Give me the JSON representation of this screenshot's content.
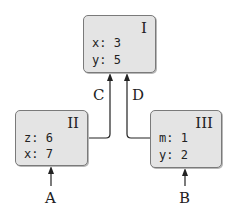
{
  "diagram": {
    "nodes": [
      {
        "id": "I",
        "title": "I",
        "fields": [
          {
            "text": "x: 3"
          },
          {
            "text": "y: 5"
          }
        ]
      },
      {
        "id": "II",
        "title": "II",
        "fields": [
          {
            "text": "z: 6"
          },
          {
            "text": "x: 7"
          }
        ]
      },
      {
        "id": "III",
        "title": "III",
        "fields": [
          {
            "text": "m: 1"
          },
          {
            "text": "y: 2"
          }
        ]
      }
    ],
    "edges": [
      {
        "label": "C",
        "from": "II",
        "to": "I"
      },
      {
        "label": "D",
        "from": "III",
        "to": "I"
      },
      {
        "label": "A",
        "from": "external",
        "to": "II"
      },
      {
        "label": "B",
        "from": "external",
        "to": "III"
      }
    ],
    "colors": {
      "box_fill": "#e4e4e4",
      "box_border": "#7a7a7a",
      "line": "#222222"
    }
  }
}
